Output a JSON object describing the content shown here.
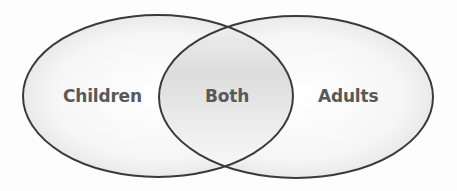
{
  "diagram": {
    "type": "venn",
    "sets": [
      {
        "id": "children",
        "label": "Children"
      },
      {
        "id": "adults",
        "label": "Adults"
      }
    ],
    "intersection": {
      "label": "Both"
    }
  },
  "colors": {
    "outline": "#3a3a3a",
    "text": "#595959",
    "shade": "#d6d6d6",
    "background": "#ffffff"
  }
}
